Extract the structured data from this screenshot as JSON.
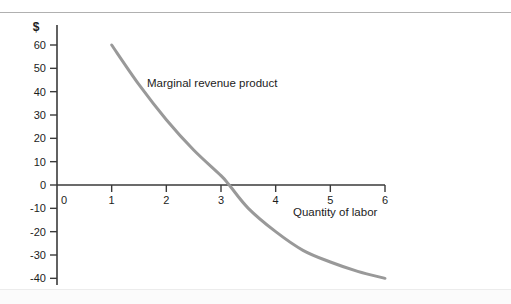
{
  "chart_data": {
    "type": "line",
    "title": "",
    "subtitle": "",
    "xlabel": "Quantity of labor",
    "ylabel": "$",
    "y_unit_symbol": "$",
    "series_label": "Marginal revenue product",
    "legend_position": "inline-annotation",
    "grid": false,
    "xlim": [
      0,
      6
    ],
    "ylim": [
      -40,
      60
    ],
    "x_ticks": [
      "0",
      "1",
      "2",
      "3",
      "4",
      "5",
      "6"
    ],
    "x_tick_values": [
      0,
      1,
      2,
      3,
      4,
      5,
      6
    ],
    "y_ticks": [
      "60",
      "50",
      "40",
      "30",
      "20",
      "10",
      "0",
      "-10",
      "-20",
      "-30",
      "-40"
    ],
    "y_tick_values": [
      60,
      50,
      40,
      30,
      20,
      10,
      0,
      -10,
      -20,
      -30,
      -40
    ],
    "zero_crossing_x": 3.15,
    "series": [
      {
        "name": "Marginal revenue product",
        "color": "#999999",
        "x": [
          1,
          1.5,
          2,
          2.5,
          3,
          3.15,
          3.5,
          4,
          4.5,
          5,
          5.5,
          6
        ],
        "values": [
          60,
          43,
          28,
          15,
          4,
          0,
          -10,
          -20,
          -28,
          -33,
          -37,
          -40
        ]
      }
    ],
    "colors": {
      "curve": "#999999",
      "axis": "#3a3a3a",
      "text": "#1c1c1c",
      "rule": "#b0b0b0",
      "background": "#ffffff"
    }
  }
}
